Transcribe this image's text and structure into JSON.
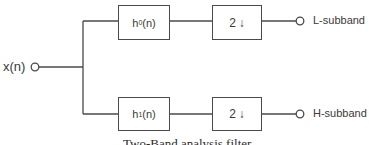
{
  "diagram": {
    "type": "block-diagram",
    "title": "Two-Band analysis filter",
    "input": {
      "label": "x(n)"
    },
    "branches": [
      {
        "filter": {
          "base": "h",
          "subscript": "0",
          "suffix": "(n)"
        },
        "downsampler": {
          "factor": "2",
          "arrow": "↓"
        },
        "output": {
          "label": "L-subband"
        }
      },
      {
        "filter": {
          "base": "h",
          "subscript": "1",
          "suffix": "(n)"
        },
        "downsampler": {
          "factor": "2",
          "arrow": "↓"
        },
        "output": {
          "label": "H-subband"
        }
      }
    ],
    "colors": {
      "line": "#4a4a4a",
      "text": "#3a3a3a",
      "background": "#ffffff"
    }
  }
}
